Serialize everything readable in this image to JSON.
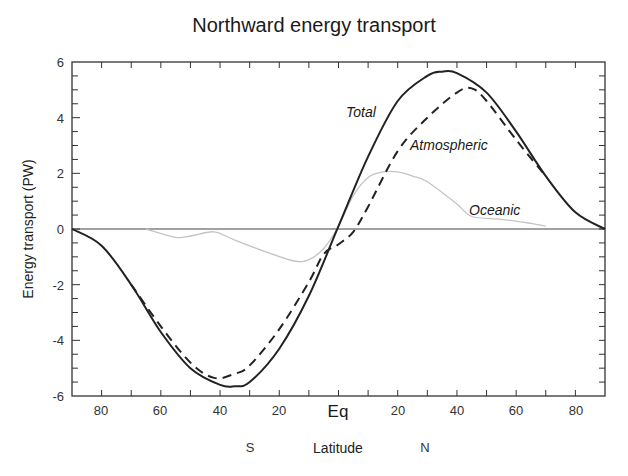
{
  "chart_data": {
    "type": "line",
    "title": "Northward energy transport",
    "xlabel": "Latitude",
    "ylabel": "Energy transport (PW)",
    "xlim": [
      -90,
      90
    ],
    "ylim": [
      -6,
      6
    ],
    "x_tick_labels": [
      "80",
      "60",
      "40",
      "20",
      "Eq",
      "20",
      "40",
      "60",
      "80"
    ],
    "x_tick_values": [
      -80,
      -60,
      -40,
      -20,
      0,
      20,
      40,
      60,
      80
    ],
    "y_tick_labels": [
      "6",
      "4",
      "2",
      "0",
      "-2",
      "-4",
      "-6"
    ],
    "y_tick_values": [
      6,
      4,
      2,
      0,
      -2,
      -4,
      -6
    ],
    "hemisphere_labels": {
      "south": "S",
      "north": "N"
    },
    "grid": false,
    "zero_line": true,
    "legend": "inline labels",
    "series": [
      {
        "name": "Total",
        "style": "solid",
        "color": "#222222",
        "x": [
          -90,
          -80,
          -70,
          -60,
          -50,
          -40,
          -35,
          -30,
          -20,
          -10,
          0,
          10,
          20,
          30,
          35,
          40,
          50,
          60,
          70,
          80,
          90
        ],
        "values": [
          0,
          -0.6,
          -2.0,
          -3.7,
          -5.0,
          -5.6,
          -5.65,
          -5.5,
          -4.3,
          -2.4,
          0.1,
          2.6,
          4.6,
          5.5,
          5.65,
          5.6,
          4.9,
          3.5,
          1.9,
          0.6,
          0
        ]
      },
      {
        "name": "Atmospheric",
        "style": "dashed",
        "color": "#222222",
        "x": [
          -70,
          -60,
          -50,
          -42,
          -35,
          -30,
          -20,
          -10,
          -5,
          0,
          5,
          10,
          20,
          30,
          40,
          45,
          50,
          60,
          70
        ],
        "values": [
          -2.0,
          -3.5,
          -4.8,
          -5.35,
          -5.2,
          -4.9,
          -3.6,
          -1.9,
          -0.9,
          -0.55,
          -0.1,
          0.8,
          2.8,
          4.0,
          4.9,
          5.05,
          4.6,
          3.2,
          1.9
        ]
      },
      {
        "name": "Oceanic",
        "style": "solid",
        "color": "#bdbdbd",
        "x": [
          -65,
          -55,
          -50,
          -42,
          -35,
          -25,
          -15,
          -10,
          -5,
          0,
          5,
          10,
          15,
          20,
          25,
          30,
          40,
          45,
          55,
          65,
          70
        ],
        "values": [
          0,
          -0.3,
          -0.25,
          -0.1,
          -0.4,
          -0.8,
          -1.15,
          -1.1,
          -0.7,
          0.1,
          1.2,
          1.85,
          2.05,
          2.05,
          1.9,
          1.7,
          0.9,
          0.45,
          0.35,
          0.2,
          0.1
        ]
      }
    ]
  },
  "labels": {
    "title": "Northward energy transport",
    "ylabel": "Energy transport (PW)",
    "xlabel": "Latitude",
    "south": "S",
    "north": "N",
    "eq": "Eq",
    "total": "Total",
    "atmospheric": "Atmospheric",
    "oceanic": "Oceanic",
    "x80s": "80",
    "x60s": "60",
    "x40s": "40",
    "x20s": "20",
    "x20n": "20",
    "x40n": "40",
    "x60n": "60",
    "x80n": "80",
    "y6": "6",
    "y4": "4",
    "y2": "2",
    "y0": "0",
    "ym2": "-2",
    "ym4": "-4",
    "ym6": "-6"
  }
}
